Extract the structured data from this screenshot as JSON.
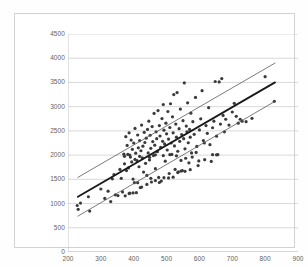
{
  "chart_data": {
    "type": "scatter",
    "title": "",
    "subtitle": "",
    "xlabel": "",
    "ylabel": "",
    "xlim": [
      200,
      900
    ],
    "ylim": [
      0,
      4500
    ],
    "x_ticks": [
      200,
      300,
      400,
      500,
      600,
      700,
      800,
      900
    ],
    "y_ticks": [
      0,
      500,
      1000,
      1500,
      2000,
      2500,
      3000,
      3500,
      4000,
      4500
    ],
    "grid": {
      "horizontal": true,
      "vertical": false,
      "color": "#c8c8c8"
    },
    "legend": {
      "visible": false,
      "position": "none"
    },
    "annotations": [],
    "series": [
      {
        "name": "data points",
        "type": "scatter",
        "marker": "dot",
        "marker_size": 1.6,
        "color": "#3a3a3a",
        "points": [
          [
            228,
            960
          ],
          [
            231,
            880
          ],
          [
            238,
            1010
          ],
          [
            262,
            1140
          ],
          [
            266,
            845
          ],
          [
            300,
            1300
          ],
          [
            312,
            1105
          ],
          [
            322,
            1255
          ],
          [
            330,
            1040
          ],
          [
            335,
            1510
          ],
          [
            340,
            1600
          ],
          [
            344,
            1180
          ],
          [
            352,
            1165
          ],
          [
            358,
            1705
          ],
          [
            362,
            1520
          ],
          [
            366,
            1240
          ],
          [
            370,
            2020
          ],
          [
            372,
            1820
          ],
          [
            376,
            2380
          ],
          [
            378,
            1680
          ],
          [
            380,
            2200
          ],
          [
            382,
            2015
          ],
          [
            384,
            1735
          ],
          [
            386,
            2460
          ],
          [
            388,
            1215
          ],
          [
            390,
            1960
          ],
          [
            392,
            2310
          ],
          [
            394,
            1860
          ],
          [
            396,
            2120
          ],
          [
            398,
            1505
          ],
          [
            400,
            2250
          ],
          [
            402,
            1430
          ],
          [
            404,
            2550
          ],
          [
            406,
            2040
          ],
          [
            408,
            1225
          ],
          [
            410,
            1885
          ],
          [
            412,
            2415
          ],
          [
            414,
            2150
          ],
          [
            416,
            1760
          ],
          [
            418,
            2300
          ],
          [
            420,
            1330
          ],
          [
            422,
            2090
          ],
          [
            424,
            2620
          ],
          [
            426,
            1945
          ],
          [
            428,
            2185
          ],
          [
            430,
            1650
          ],
          [
            432,
            2470
          ],
          [
            434,
            2260
          ],
          [
            436,
            1830
          ],
          [
            438,
            2350
          ],
          [
            440,
            1580
          ],
          [
            442,
            2530
          ],
          [
            444,
            2045
          ],
          [
            446,
            2700
          ],
          [
            448,
            1900
          ],
          [
            450,
            2410
          ],
          [
            452,
            2140
          ],
          [
            454,
            1445
          ],
          [
            456,
            2590
          ],
          [
            458,
            2280
          ],
          [
            460,
            1990
          ],
          [
            462,
            2860
          ],
          [
            464,
            2205
          ],
          [
            466,
            1720
          ],
          [
            468,
            2480
          ],
          [
            470,
            2340
          ],
          [
            472,
            2070
          ],
          [
            474,
            2920
          ],
          [
            476,
            1540
          ],
          [
            478,
            2610
          ],
          [
            480,
            2395
          ],
          [
            482,
            2160
          ],
          [
            484,
            1465
          ],
          [
            486,
            2755
          ],
          [
            488,
            2285
          ],
          [
            490,
            3045
          ],
          [
            492,
            2515
          ],
          [
            494,
            2230
          ],
          [
            496,
            1875
          ],
          [
            498,
            2660
          ],
          [
            500,
            2440
          ],
          [
            502,
            2105
          ],
          [
            504,
            2900
          ],
          [
            506,
            2330
          ],
          [
            508,
            1620
          ],
          [
            510,
            2570
          ],
          [
            512,
            3060
          ],
          [
            514,
            2250
          ],
          [
            516,
            2015
          ],
          [
            518,
            2790
          ],
          [
            520,
            2460
          ],
          [
            522,
            3250
          ],
          [
            524,
            2190
          ],
          [
            526,
            1705
          ],
          [
            528,
            2640
          ],
          [
            530,
            2370
          ],
          [
            532,
            3290
          ],
          [
            534,
            2080
          ],
          [
            536,
            1655
          ],
          [
            538,
            2545
          ],
          [
            540,
            2285
          ],
          [
            542,
            2950
          ],
          [
            544,
            1890
          ],
          [
            546,
            2425
          ],
          [
            548,
            1680
          ],
          [
            550,
            2710
          ],
          [
            552,
            2340
          ],
          [
            554,
            3490
          ],
          [
            556,
            2130
          ],
          [
            558,
            1935
          ],
          [
            560,
            2600
          ],
          [
            562,
            2480
          ],
          [
            564,
            3080
          ],
          [
            566,
            2255
          ],
          [
            568,
            1840
          ],
          [
            570,
            2530
          ],
          [
            572,
            2370
          ],
          [
            574,
            2865
          ],
          [
            576,
            2045
          ],
          [
            578,
            1960
          ],
          [
            580,
            2690
          ],
          [
            584,
            2430
          ],
          [
            588,
            3190
          ],
          [
            592,
            2180
          ],
          [
            596,
            1785
          ],
          [
            600,
            2520
          ],
          [
            604,
            2750
          ],
          [
            608,
            3330
          ],
          [
            612,
            2300
          ],
          [
            616,
            1905
          ],
          [
            620,
            2610
          ],
          [
            624,
            2450
          ],
          [
            628,
            2980
          ],
          [
            632,
            2215
          ],
          [
            636,
            1870
          ],
          [
            640,
            2565
          ],
          [
            644,
            2700
          ],
          [
            648,
            3520
          ],
          [
            652,
            2390
          ],
          [
            656,
            2010
          ],
          [
            660,
            3510
          ],
          [
            664,
            2640
          ],
          [
            668,
            3580
          ],
          [
            672,
            2820
          ],
          [
            676,
            2480
          ],
          [
            680,
            2740
          ],
          [
            690,
            2620
          ],
          [
            700,
            2890
          ],
          [
            706,
            3070
          ],
          [
            712,
            2800
          ],
          [
            718,
            2660
          ],
          [
            724,
            2740
          ],
          [
            730,
            2700
          ],
          [
            640,
            2010
          ],
          [
            652,
            2005
          ],
          [
            615,
            2250
          ],
          [
            590,
            2055
          ],
          [
            598,
            1880
          ],
          [
            572,
            1700
          ],
          [
            556,
            1665
          ],
          [
            544,
            1670
          ],
          [
            534,
            1640
          ],
          [
            520,
            1545
          ],
          [
            506,
            1530
          ],
          [
            492,
            1535
          ],
          [
            478,
            1435
          ],
          [
            466,
            1475
          ],
          [
            452,
            1520
          ],
          [
            440,
            1395
          ],
          [
            424,
            1340
          ],
          [
            412,
            1430
          ],
          [
            398,
            1220
          ],
          [
            386,
            1205
          ],
          [
            374,
            1160
          ],
          [
            800,
            3620
          ],
          [
            828,
            3110
          ],
          [
            760,
            2760
          ],
          [
            742,
            2690
          ],
          [
            466,
            2005
          ],
          [
            490,
            1990
          ],
          [
            510,
            2010
          ],
          [
            530,
            1985
          ],
          [
            448,
            1955
          ],
          [
            418,
            1975
          ],
          [
            404,
            1910
          ],
          [
            388,
            2000
          ],
          [
            372,
            1975
          ]
        ]
      },
      {
        "name": "regression line",
        "type": "line",
        "color": "#1a1a1a",
        "width": 1.9,
        "x": [
          230,
          830
        ],
        "y": [
          1140,
          3500
        ]
      },
      {
        "name": "upper bound line",
        "type": "line",
        "color": "#5a5a5a",
        "width": 0.8,
        "x": [
          230,
          830
        ],
        "y": [
          1540,
          3900
        ]
      },
      {
        "name": "lower bound line",
        "type": "line",
        "color": "#5a5a5a",
        "width": 0.8,
        "x": [
          230,
          830
        ],
        "y": [
          740,
          3110
        ]
      }
    ]
  }
}
